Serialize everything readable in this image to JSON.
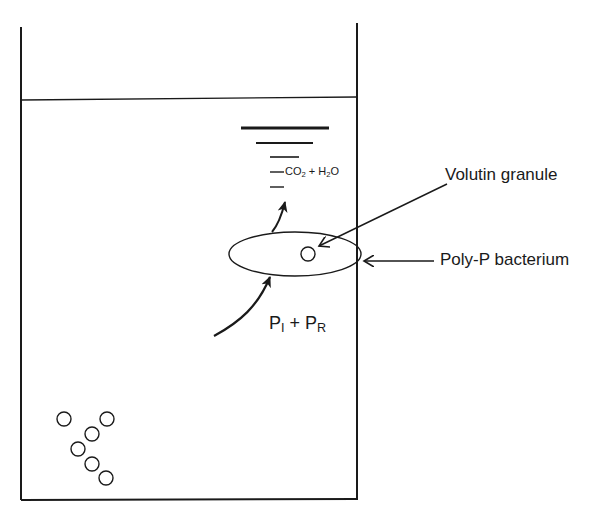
{
  "diagram": {
    "title": "",
    "colors": {
      "stroke": "#1a1a1a",
      "background": "#ffffff"
    },
    "labels": {
      "co2_h2o": {
        "prefix": "CO",
        "co2_sub": "2",
        "mid": " + H",
        "h2o_sub": "2",
        "suffix": "O"
      },
      "volutin_granule": "Volutin granule",
      "poly_p_bacterium": "Poly-P bacterium",
      "phosphate": {
        "p1": "P",
        "p1_sub": "I",
        "plus": " + ",
        "p2": "P",
        "p2_sub": "R"
      }
    },
    "elements": {
      "tank": "Reactor tank with liquid",
      "surface_lines": 5,
      "bacterium": "Ellipse representing Poly-P bacterium",
      "granule": "Volutin granule inside bacterium",
      "sediment_circles": 6
    }
  }
}
